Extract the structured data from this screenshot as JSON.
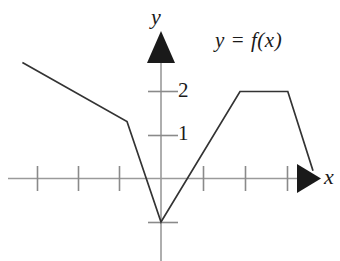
{
  "figure": {
    "background_color": "#ffffff",
    "ink_color": "#1a1a1a",
    "axis_color": "#888888"
  },
  "labels": {
    "y_axis": "y",
    "x_axis": "x",
    "curve": "y = f(x)",
    "tick_2": "2",
    "tick_1": "1"
  },
  "chart_data": {
    "type": "line",
    "title": "",
    "subtitle": "",
    "xlabel": "x",
    "ylabel": "y",
    "series": [
      {
        "name": "y = f(x)",
        "color": "#333333",
        "x": [
          -3.3,
          -0.81,
          0,
          1.88,
          3.02,
          3.62
        ],
        "values": [
          2.67,
          1.31,
          -1,
          2,
          2,
          0.18
        ],
        "points": [
          {
            "x": -3.3,
            "y": 2.67,
            "role": "left-endpoint"
          },
          {
            "x": -0.81,
            "y": 1.31,
            "role": "corner"
          },
          {
            "x": 0,
            "y": -1,
            "role": "minimum-vertex"
          },
          {
            "x": 1.88,
            "y": 2,
            "role": "plateau-start"
          },
          {
            "x": 3.02,
            "y": 2,
            "role": "plateau-end"
          },
          {
            "x": 3.62,
            "y": 0.18,
            "role": "right-endpoint"
          }
        ]
      }
    ],
    "xlim": [
      -3.85,
      4.3
    ],
    "ylim": [
      -1.9,
      2.9
    ],
    "x_ticks": [
      -3,
      -2,
      -1,
      1,
      2,
      3
    ],
    "y_ticks": [
      -1,
      1,
      2
    ],
    "y_tick_labels": [
      "",
      "1",
      "2"
    ],
    "x_tick_labels": [
      "",
      "",
      "",
      "",
      "",
      ""
    ],
    "grid": false,
    "legend": "none",
    "annotations": [
      {
        "text": "y = f(x)",
        "x": 1.3,
        "y": 2.75
      },
      {
        "text": "y",
        "x": -0.05,
        "y": 3.1
      },
      {
        "text": "x",
        "x": 3.95,
        "y": 0.1
      }
    ],
    "axis_arrows": {
      "x": "right",
      "y": "up"
    }
  }
}
